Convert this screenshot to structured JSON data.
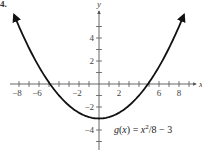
{
  "problem_number": "4.",
  "chart_data": {
    "type": "line",
    "title": "",
    "function_label": {
      "prefix": "g(x) = x",
      "superscript": "2",
      "suffix": "/8 − 3"
    },
    "expression": "g(x) = x^2/8 - 3",
    "xlabel": "x",
    "ylabel": "y",
    "xlim": [
      -9,
      9.5
    ],
    "ylim": [
      -5.5,
      6.5
    ],
    "x_ticks": [
      -8,
      -7,
      -6,
      -5,
      -4,
      -3,
      -2,
      -1,
      1,
      2,
      3,
      4,
      5,
      6,
      7,
      8,
      9
    ],
    "x_tick_labels": [
      "-8",
      "-6",
      "-2",
      "2",
      "6",
      "8"
    ],
    "y_ticks": [
      -5,
      -4,
      -3,
      -2,
      -1,
      1,
      2,
      3,
      4,
      5
    ],
    "y_tick_labels": [
      "4",
      "2",
      "-2",
      "-4"
    ],
    "grid": false,
    "legend": null,
    "series": [
      {
        "name": "g(x) = x^2/8 - 3",
        "x": [
          -8.5,
          -8,
          -6,
          -4.9,
          -4,
          -2,
          0,
          2,
          4,
          4.9,
          6,
          8,
          8.5
        ],
        "y": [
          6.03,
          5,
          1.5,
          0,
          -1,
          -2.5,
          -3,
          -2.5,
          -1,
          0,
          1.5,
          5,
          6.03
        ]
      }
    ],
    "annotations": [
      "vertex at (0, -3)",
      "x-intercepts at about ±4.9",
      "arrows at both ends of curve"
    ]
  },
  "colors": {
    "curve": "#111111",
    "axis": "#555555",
    "text": "#444444"
  }
}
